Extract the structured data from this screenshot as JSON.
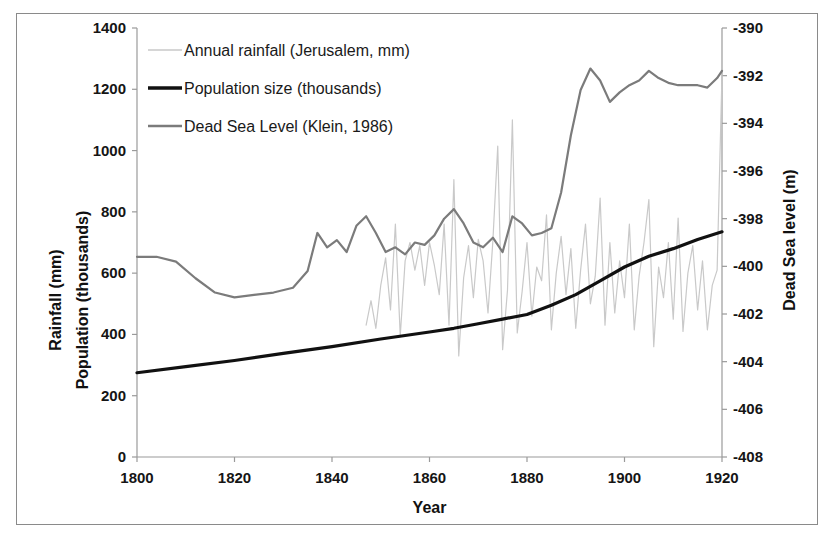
{
  "chart_data": {
    "type": "line",
    "title": "",
    "xlabel": "Year",
    "ylabel_left_line1": "Rainfall (mm)",
    "ylabel_left_line2": "Population (thousands)",
    "ylabel_right": "Dead Sea level (m)",
    "xlim": [
      1800,
      1920
    ],
    "xticks": [
      1800,
      1820,
      1840,
      1860,
      1880,
      1900,
      1920
    ],
    "xticklabels": [
      "1800",
      "1820",
      "1840",
      "1860",
      "1880",
      "1900",
      "1920"
    ],
    "ylim_left": [
      0,
      1400
    ],
    "yticks_left": [
      0,
      200,
      400,
      600,
      800,
      1000,
      1200,
      1400
    ],
    "yticklabels_left": [
      "0",
      "200",
      "400",
      "600",
      "800",
      "1000",
      "1200",
      "1400"
    ],
    "ylim_right": [
      -408,
      -390
    ],
    "yticks_right": [
      -408,
      -406,
      -404,
      -402,
      -400,
      -398,
      -396,
      -394,
      -392,
      -390
    ],
    "yticklabels_right": [
      "-408",
      "-406",
      "-404",
      "-402",
      "-400",
      "-398",
      "-396",
      "-394",
      "-392",
      "-390"
    ],
    "grid": false,
    "legend_position": "top-left-inside",
    "series": [
      {
        "name": "Annual rainfall (Jerusalem, mm)",
        "axis": "left",
        "color": "#c9c9c9",
        "width": 1.2,
        "x": [
          1847,
          1848,
          1849,
          1850,
          1851,
          1852,
          1853,
          1854,
          1855,
          1856,
          1857,
          1858,
          1859,
          1860,
          1861,
          1862,
          1863,
          1864,
          1865,
          1866,
          1867,
          1868,
          1869,
          1870,
          1871,
          1872,
          1873,
          1874,
          1875,
          1876,
          1877,
          1878,
          1879,
          1880,
          1881,
          1882,
          1883,
          1884,
          1885,
          1886,
          1887,
          1888,
          1889,
          1890,
          1891,
          1892,
          1893,
          1894,
          1895,
          1896,
          1897,
          1898,
          1899,
          1900,
          1901,
          1902,
          1903,
          1904,
          1905,
          1906,
          1907,
          1908,
          1909,
          1910,
          1911,
          1912,
          1913,
          1914,
          1915,
          1916,
          1917,
          1918,
          1919,
          1920
        ],
        "values": [
          430,
          510,
          420,
          560,
          650,
          480,
          760,
          395,
          640,
          700,
          610,
          690,
          560,
          700,
          625,
          530,
          760,
          430,
          905,
          330,
          585,
          690,
          520,
          710,
          640,
          470,
          705,
          1015,
          350,
          545,
          1100,
          405,
          540,
          700,
          460,
          620,
          575,
          790,
          415,
          600,
          720,
          530,
          680,
          420,
          610,
          760,
          500,
          590,
          845,
          430,
          700,
          470,
          640,
          520,
          760,
          415,
          590,
          700,
          840,
          360,
          620,
          520,
          700,
          450,
          780,
          410,
          600,
          690,
          480,
          640,
          415,
          560,
          610,
          1250
        ]
      },
      {
        "name": "Population size (thousands)",
        "axis": "left",
        "color": "#111111",
        "width": 3.2,
        "x": [
          1800,
          1810,
          1820,
          1830,
          1840,
          1850,
          1860,
          1865,
          1870,
          1875,
          1880,
          1885,
          1890,
          1895,
          1900,
          1905,
          1910,
          1915,
          1920
        ],
        "values": [
          275,
          295,
          315,
          338,
          360,
          385,
          408,
          420,
          435,
          450,
          465,
          495,
          530,
          575,
          620,
          655,
          680,
          710,
          735
        ]
      },
      {
        "name": "Dead Sea Level (Klein, 1986)",
        "axis": "right",
        "color": "#7b7b7b",
        "width": 2.2,
        "x": [
          1800,
          1804,
          1808,
          1812,
          1816,
          1820,
          1824,
          1828,
          1832,
          1835,
          1837,
          1839,
          1841,
          1843,
          1845,
          1847,
          1849,
          1851,
          1853,
          1855,
          1857,
          1859,
          1861,
          1863,
          1865,
          1867,
          1869,
          1871,
          1873,
          1875,
          1877,
          1879,
          1881,
          1883,
          1885,
          1887,
          1889,
          1891,
          1893,
          1895,
          1897,
          1899,
          1901,
          1903,
          1905,
          1907,
          1909,
          1911,
          1913,
          1915,
          1917,
          1919,
          1920
        ],
        "values": [
          -399.6,
          -399.6,
          -399.8,
          -400.5,
          -401.1,
          -401.3,
          -401.2,
          -401.1,
          -400.9,
          -400.2,
          -398.6,
          -399.2,
          -398.9,
          -399.4,
          -398.3,
          -397.9,
          -398.6,
          -399.4,
          -399.2,
          -399.5,
          -399.0,
          -399.1,
          -398.7,
          -398.0,
          -397.6,
          -398.2,
          -399.0,
          -399.2,
          -398.8,
          -399.4,
          -397.9,
          -398.2,
          -398.7,
          -398.6,
          -398.4,
          -396.9,
          -394.5,
          -392.6,
          -391.7,
          -392.2,
          -393.1,
          -392.7,
          -392.4,
          -392.2,
          -391.8,
          -392.1,
          -392.3,
          -392.4,
          -392.4,
          -392.4,
          -392.5,
          -392.1,
          -391.8
        ]
      }
    ],
    "legend": [
      {
        "label": "Annual rainfall (Jerusalem, mm)",
        "color": "#c9c9c9",
        "width": 1.6
      },
      {
        "label": "Population size (thousands)",
        "color": "#111111",
        "width": 3.4
      },
      {
        "label": "Dead Sea Level (Klein, 1986)",
        "color": "#7b7b7b",
        "width": 2.4
      }
    ]
  }
}
